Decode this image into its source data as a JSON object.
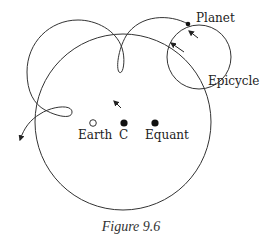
{
  "figure": {
    "caption": "Figure 9.6",
    "labels": {
      "planet": "Planet",
      "epicycle": "Epicycle",
      "earth": "Earth",
      "center": "C",
      "equant": "Equant"
    },
    "colors": {
      "stroke": "#333333",
      "text": "#222222"
    }
  }
}
